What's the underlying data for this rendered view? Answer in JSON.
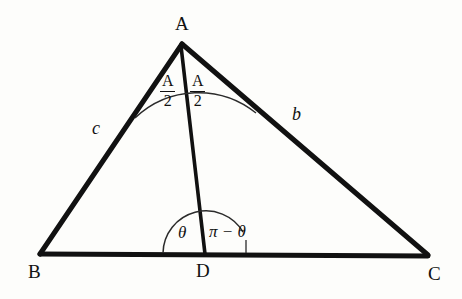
{
  "figure": {
    "type": "geometry-diagram",
    "background_color": "#fdfdfb",
    "stroke_color": "#111111"
  },
  "vertices": {
    "apex": {
      "label": "A",
      "x": 182,
      "y": 42
    },
    "bottom_left": {
      "label": "B",
      "x": 40,
      "y": 253
    },
    "bottom_right": {
      "label": "C",
      "x": 428,
      "y": 255
    },
    "foot": {
      "label": "D",
      "x": 205,
      "y": 253
    }
  },
  "sides": {
    "left": {
      "label": "c",
      "from": "A",
      "to": "B"
    },
    "right": {
      "label": "b",
      "from": "A",
      "to": "C"
    }
  },
  "angles": {
    "apex_left": {
      "numerator": "A",
      "denominator": "2"
    },
    "apex_right": {
      "numerator": "A",
      "denominator": "2"
    },
    "foot_left": {
      "label": "θ"
    },
    "foot_right": {
      "label": "π − θ"
    }
  }
}
